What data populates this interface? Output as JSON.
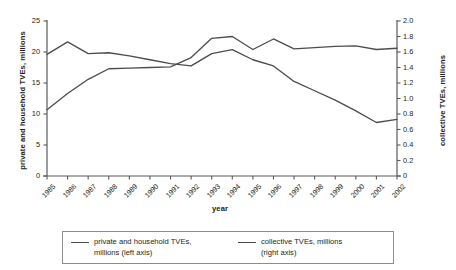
{
  "chart_data": {
    "type": "line",
    "title": "",
    "xlabel": "year",
    "ylabel_left": "private and household TVEs, millions",
    "ylabel_right": "collective TVEs, millions",
    "grid": false,
    "legend_position": "bottom",
    "x": [
      1985,
      1986,
      1987,
      1988,
      1989,
      1990,
      1991,
      1992,
      1993,
      1994,
      1995,
      1996,
      1997,
      1998,
      1999,
      2000,
      2001,
      2002
    ],
    "xtick_labels": [
      "1985",
      "1986",
      "1987",
      "1988",
      "1989",
      "1990",
      "1991",
      "1992",
      "1993",
      "1994",
      "1995",
      "1996",
      "1997",
      "1998",
      "1999",
      "2000",
      "2001",
      "2002"
    ],
    "ylim_left": [
      0,
      25
    ],
    "ytick_labels_left": [
      "0",
      "5",
      "10",
      "15",
      "20",
      "25"
    ],
    "ytick_values_left": [
      0,
      5,
      10,
      15,
      20,
      25
    ],
    "ylim_right": [
      0,
      2.0
    ],
    "ytick_labels_right": [
      "0",
      "0.2",
      "0.4",
      "0.6",
      "0.8",
      "1.0",
      "1.2",
      "1.4",
      "1.6",
      "1.8",
      "2.0"
    ],
    "ytick_values_right": [
      0,
      0.2,
      0.4,
      0.6,
      0.8,
      1.0,
      1.2,
      1.4,
      1.6,
      1.8,
      2.0
    ],
    "series": [
      {
        "name": "private and household TVEs, millions (left axis)",
        "axis": "left",
        "color": "#4d4d4d",
        "values": [
          10.7,
          13.3,
          15.6,
          17.3,
          17.4,
          17.5,
          17.6,
          19.1,
          22.2,
          22.5,
          20.4,
          22.1,
          20.5,
          20.7,
          20.9,
          21.0,
          20.4,
          20.6
        ]
      },
      {
        "name": "collective TVEs, millions (right axis)",
        "axis": "right",
        "color": "#4d4d4d",
        "values": [
          1.57,
          1.73,
          1.58,
          1.59,
          1.55,
          1.5,
          1.45,
          1.42,
          1.58,
          1.63,
          1.5,
          1.42,
          1.22,
          1.1,
          0.98,
          0.84,
          0.69,
          0.73
        ]
      }
    ]
  },
  "legend": {
    "entries": [
      {
        "label_line1": "private and household TVEs,",
        "label_line2": "millions (left axis)"
      },
      {
        "label_line1": "collective TVEs, millions",
        "label_line2": "(right axis)"
      }
    ]
  }
}
